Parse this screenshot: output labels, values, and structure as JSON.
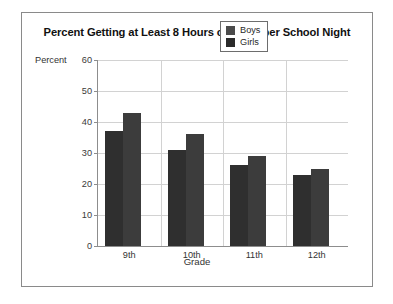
{
  "figure": {
    "title": "Percent Getting at Least 8 Hours of Sleep per School Night",
    "y_caption": "Percent",
    "x_caption": "Grade"
  },
  "legend": {
    "items": [
      {
        "label": "Boys",
        "swatch": "boys",
        "color": "#4b4b4b"
      },
      {
        "label": "Girls",
        "swatch": "girls",
        "color": "#2a2a2a"
      }
    ]
  },
  "chart_data": {
    "type": "bar",
    "title": "Percent Getting at Least 8 Hours of Sleep per School Night",
    "xlabel": "Grade",
    "ylabel": "Percent",
    "categories": [
      "9th",
      "10th",
      "11th",
      "12th"
    ],
    "series": [
      {
        "name": "Boys",
        "values": [
          37,
          31,
          26,
          23
        ],
        "color": "#2f2f2f"
      },
      {
        "name": "Girls",
        "values": [
          43,
          36,
          29,
          25
        ],
        "color": "#3c3c3c"
      }
    ],
    "ylim": [
      0,
      60
    ],
    "yticks": [
      0,
      10,
      20,
      30,
      40,
      50,
      60
    ],
    "ytick_labels": [
      "0",
      "10",
      "20",
      "30",
      "40",
      "50",
      "60"
    ],
    "grid": true,
    "legend_position": "top-right"
  }
}
